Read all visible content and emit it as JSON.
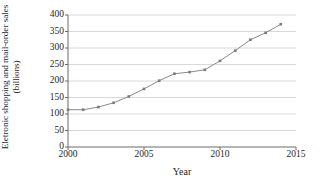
{
  "chart_data": {
    "type": "line",
    "title": "",
    "xlabel": "Year",
    "ylabel": "Eletronic shopping and mail-order sales (billions)",
    "x": [
      2000,
      2001,
      2002,
      2003,
      2004,
      2005,
      2006,
      2007,
      2008,
      2009,
      2010,
      2011,
      2012,
      2013,
      2014
    ],
    "values": [
      113,
      113,
      121,
      134,
      153,
      176,
      201,
      222,
      227,
      234,
      261,
      292,
      325,
      346,
      372
    ],
    "series": [
      {
        "name": "Eletronic shopping and mail-order sales",
        "values": [
          113,
          113,
          121,
          134,
          153,
          176,
          201,
          222,
          227,
          234,
          261,
          292,
          325,
          346,
          372
        ]
      }
    ],
    "xlim": [
      2000,
      2015
    ],
    "ylim": [
      0,
      400
    ],
    "xticks": [
      "2000",
      "2005",
      "2010",
      "2015"
    ],
    "xtick_values": [
      2000,
      2005,
      2010,
      2015
    ],
    "yticks": [
      "0",
      "50",
      "100",
      "150",
      "200",
      "250",
      "300",
      "350",
      "400"
    ],
    "ytick_values": [
      0,
      50,
      100,
      150,
      200,
      250,
      300,
      350,
      400
    ],
    "grid": "horizontal",
    "legend": "none",
    "marker": "square",
    "colors": {
      "line": "#8a8a8a",
      "marker": "#7d7a77",
      "grid": "#c8c8c8",
      "axis": "#6a6a6a",
      "text": "#1f1f1f",
      "background": "#ffffff"
    }
  }
}
